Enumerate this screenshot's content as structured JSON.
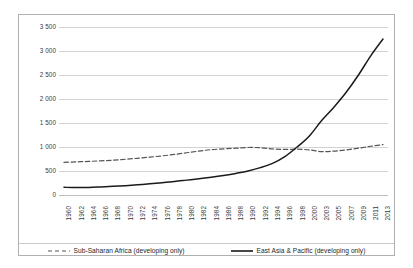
{
  "chart_data": {
    "type": "line",
    "title": "",
    "subtitle": "",
    "xlabel": "",
    "ylabel": "",
    "grid": true,
    "legend_position": "bottom",
    "ylim": [
      0,
      3500
    ],
    "y_ticks": [
      0,
      500,
      1000,
      1500,
      2000,
      2500,
      3000,
      3500
    ],
    "y_tick_labels": [
      "0",
      "500",
      "1 000",
      "1 500",
      "2 000",
      "2 500",
      "3 000",
      "3 500"
    ],
    "categories": [
      "1960",
      "1962",
      "1964",
      "1966",
      "1968",
      "1970",
      "1972",
      "1974",
      "1976",
      "1978",
      "1980",
      "1982",
      "1984",
      "1986",
      "1988",
      "1990",
      "1992",
      "1994",
      "1996",
      "1998",
      "2000",
      "2003",
      "2005",
      "2007",
      "2009",
      "2011",
      "2013"
    ],
    "series": [
      {
        "name": "Sub-Saharan Africa (developing only)",
        "style": "dashed",
        "color": "#555555",
        "values": [
          680,
          690,
          700,
          712,
          725,
          745,
          765,
          790,
          815,
          845,
          880,
          915,
          945,
          960,
          975,
          990,
          985,
          960,
          950,
          955,
          940,
          905,
          915,
          940,
          975,
          1015,
          1050
        ]
      },
      {
        "name": "East Asia & Pacific (developing only)",
        "style": "solid",
        "color": "#1a1a1a",
        "values": [
          160,
          155,
          158,
          168,
          180,
          195,
          212,
          232,
          255,
          280,
          310,
          340,
          372,
          408,
          450,
          500,
          570,
          660,
          800,
          1000,
          1230,
          1550,
          1830,
          2140,
          2500,
          2900,
          3250
        ]
      }
    ]
  },
  "legend": {
    "items": [
      {
        "label": "Sub-Saharan Africa (developing only)",
        "marker": "dashed-line-icon"
      },
      {
        "label": "East Asia & Pacific (developing only)",
        "marker": "solid-line-icon"
      }
    ]
  }
}
